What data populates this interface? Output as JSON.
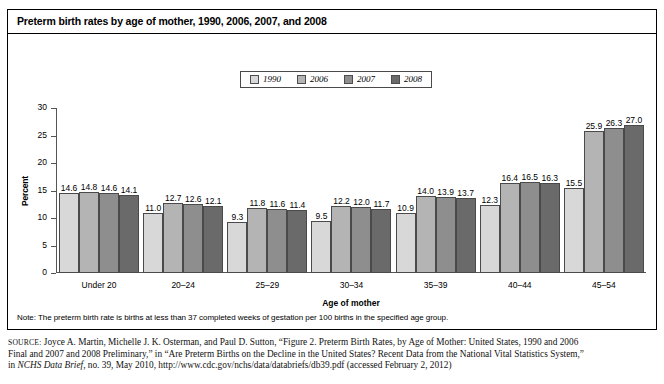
{
  "figure": {
    "title": "Preterm birth rates by age of mother, 1990, 2006, 2007, and 2008",
    "note": "Note: The preterm birth rate is births at less than 37 completed weeks of gestation per 100 births in the specified age group."
  },
  "source": {
    "label": "SOURCE:",
    "line1_a": " Joyce A. Martin, Michelle J. K. Osterman, and Paul D. Sutton, “Figure 2. Preterm Birth Rates, by Age of Mother: United States, 1990 and 2006",
    "line2_a": "Final and 2007 and 2008 Preliminary,” in “Are Preterm Births on the Decline in the United States? Recent Data from the National Vital Statistics System,”",
    "line3_a": "in ",
    "line3_italic": "NCHS Data Brief",
    "line3_b": ", no. 39, May 2010, http://www.cdc.gov/nchs/data/databriefs/db39.pdf (accessed February 2, 2012)"
  },
  "colors": {
    "series_1990": "#d8d8d8",
    "series_2006": "#b4b4b4",
    "series_2007": "#8e8e8e",
    "series_2008": "#6a6a6a",
    "axis": "#555555",
    "border": "#000000"
  },
  "chart_data": {
    "type": "bar",
    "title": "Preterm birth rates by age of mother, 1990, 2006, 2007, and 2008",
    "xlabel": "Age of mother",
    "ylabel": "Percent",
    "ylim": [
      0,
      30
    ],
    "yticks": [
      0,
      5,
      10,
      15,
      20,
      25,
      30
    ],
    "ytick_labels": [
      "0",
      "5",
      "10",
      "15",
      "20",
      "25",
      "30"
    ],
    "grid": false,
    "legend_position": "top-center",
    "categories": [
      "Under 20",
      "20–24",
      "25–29",
      "30–34",
      "35–39",
      "40–44",
      "45–54"
    ],
    "series": [
      {
        "name": "1990",
        "color": "#d8d8d8",
        "values": [
          14.6,
          11.0,
          9.3,
          9.5,
          10.9,
          12.3,
          15.5
        ],
        "labels": [
          "14.6",
          "11.0",
          "9.3",
          "9.5",
          "10.9",
          "12.3",
          "15.5"
        ]
      },
      {
        "name": "2006",
        "color": "#b4b4b4",
        "values": [
          14.8,
          12.7,
          11.8,
          12.2,
          14.0,
          16.4,
          25.9
        ],
        "labels": [
          "14.8",
          "12.7",
          "11.8",
          "12.2",
          "14.0",
          "16.4",
          "25.9"
        ]
      },
      {
        "name": "2007",
        "color": "#8e8e8e",
        "values": [
          14.6,
          12.6,
          11.6,
          12.0,
          13.9,
          16.5,
          26.3
        ],
        "labels": [
          "14.6",
          "12.6",
          "11.6",
          "12.0",
          "13.9",
          "16.5",
          "26.3"
        ]
      },
      {
        "name": "2008",
        "color": "#6a6a6a",
        "values": [
          14.1,
          12.1,
          11.4,
          11.7,
          13.7,
          16.3,
          27.0
        ],
        "labels": [
          "14.1",
          "12.1",
          "11.4",
          "11.7",
          "13.7",
          "16.3",
          "27.0"
        ]
      }
    ]
  }
}
